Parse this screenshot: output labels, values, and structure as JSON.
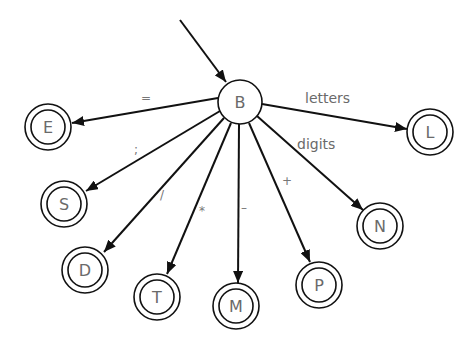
{
  "diagram": {
    "type": "finite-state-automaton",
    "start_state": "B",
    "nodes": [
      {
        "id": "B",
        "label": "B",
        "accepting": false,
        "cx": 240,
        "cy": 102
      },
      {
        "id": "E",
        "label": "E",
        "accepting": true,
        "cx": 48,
        "cy": 127
      },
      {
        "id": "S",
        "label": "S",
        "accepting": true,
        "cx": 64,
        "cy": 204
      },
      {
        "id": "D",
        "label": "D",
        "accepting": true,
        "cx": 85,
        "cy": 270
      },
      {
        "id": "T",
        "label": "T",
        "accepting": true,
        "cx": 157,
        "cy": 297
      },
      {
        "id": "M",
        "label": "M",
        "accepting": true,
        "cx": 236,
        "cy": 306
      },
      {
        "id": "P",
        "label": "P",
        "accepting": true,
        "cx": 319,
        "cy": 285
      },
      {
        "id": "N",
        "label": "N",
        "accepting": true,
        "cx": 380,
        "cy": 226
      },
      {
        "id": "L",
        "label": "L",
        "accepting": true,
        "cx": 430,
        "cy": 132
      }
    ],
    "edges": [
      {
        "from": "B",
        "to": "E",
        "label": "="
      },
      {
        "from": "B",
        "to": "S",
        "label": ";"
      },
      {
        "from": "B",
        "to": "D",
        "label": "/"
      },
      {
        "from": "B",
        "to": "T",
        "label": "*"
      },
      {
        "from": "B",
        "to": "M",
        "label": "-"
      },
      {
        "from": "B",
        "to": "P",
        "label": "+"
      },
      {
        "from": "B",
        "to": "N",
        "label": "digits"
      },
      {
        "from": "B",
        "to": "L",
        "label": "letters"
      }
    ]
  },
  "labels": {
    "B": "B",
    "E": "E",
    "S": "S",
    "D": "D",
    "T": "T",
    "M": "M",
    "P": "P",
    "N": "N",
    "L": "L",
    "edge_eq": "=",
    "edge_semicolon": ";",
    "edge_slash": "/",
    "edge_star": "*",
    "edge_minus": "–",
    "edge_plus": "+",
    "edge_digits": "digits",
    "edge_letters": "letters"
  }
}
